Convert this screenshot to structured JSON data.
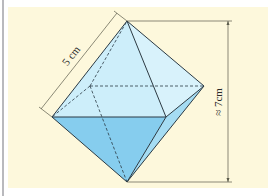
{
  "figure": {
    "type": "octahedron",
    "background_color": "#fdf8dc",
    "face_upper_color": "#cdeefa",
    "face_lower_color": "#86cdee",
    "face_lower_right_color": "#a5dcf3",
    "edge_color": "#2b3a44",
    "dimension_color": "#5a5a4a"
  },
  "labels": {
    "edge_length": "5 cm",
    "height": "≈ 7cm"
  }
}
